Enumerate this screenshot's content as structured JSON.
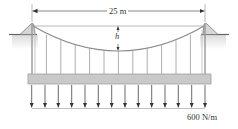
{
  "diagram": {
    "span_label": "25 m",
    "sag_label": "h",
    "load_label": "600 N/m",
    "hanger_count": 11,
    "load_arrow_count": 14,
    "colors": {
      "line": "#555555",
      "cable": "#8a8a8a",
      "deck_fill": "#c8c8c8",
      "deck_stroke": "#9a9a9a",
      "ground_shade": "#e6e6e6",
      "tower": "#9a9a9a"
    }
  }
}
